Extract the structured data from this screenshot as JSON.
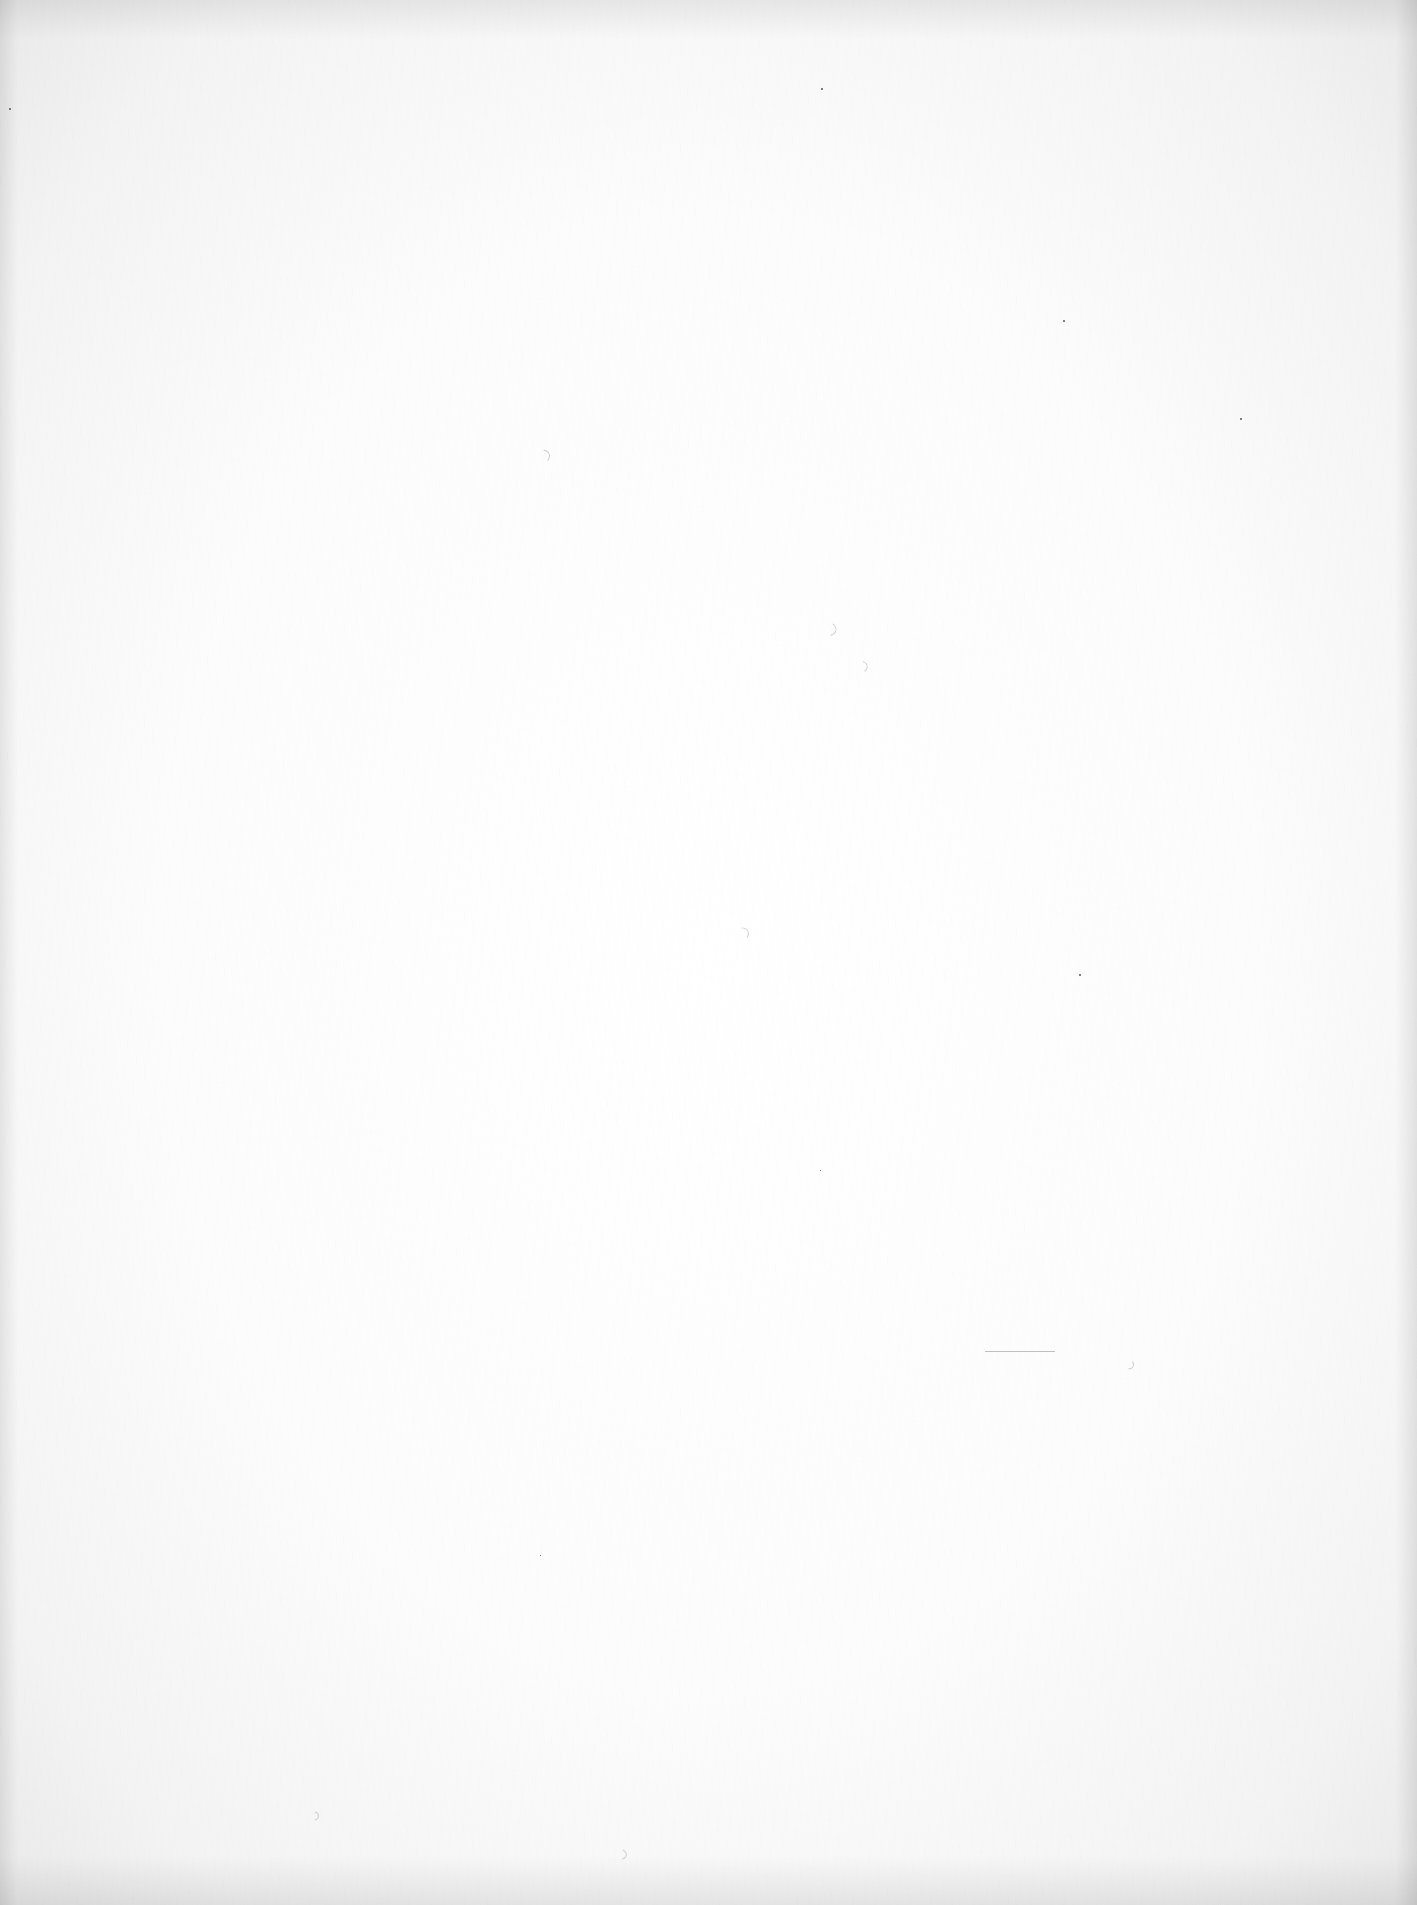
{
  "document": {
    "type": "blank-scanned-page",
    "text": "",
    "background_color": "#fdfdfd"
  }
}
